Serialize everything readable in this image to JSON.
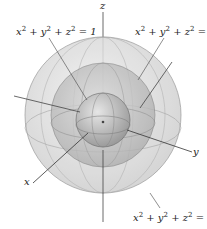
{
  "figure": {
    "axes": {
      "x": "x",
      "y": "y",
      "z": "z"
    },
    "spheres": [
      {
        "label": "x² + y² + z² = 1",
        "radius": 1
      },
      {
        "label": "x² + y² + z² = 4",
        "radius": 2
      },
      {
        "label": "x² + y² + z² = 9",
        "radius": 3
      }
    ],
    "labels": {
      "sphere1": [
        "x",
        "2",
        " + y",
        "2",
        " + z",
        "2",
        " = 1"
      ],
      "sphere2": [
        "x",
        "2",
        " + y",
        "2",
        " + z",
        "2",
        " = 4"
      ],
      "sphere3": [
        "x",
        "2",
        " + y",
        "2",
        " + z",
        "2",
        " = 9"
      ]
    }
  }
}
